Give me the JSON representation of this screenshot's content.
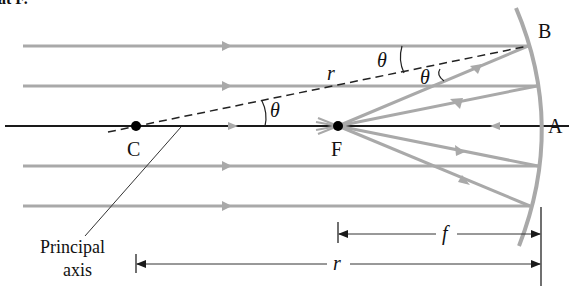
{
  "header": {
    "cutoff_text": "at F."
  },
  "diagram": {
    "colors": {
      "ray": "#a9a9a9",
      "axis": "#1a1a1a",
      "mirror": "#a9a9a9",
      "text": "#111111",
      "dashed": "#222222"
    },
    "labels": {
      "point_b": "B",
      "point_a": "A",
      "point_c": "C",
      "point_f": "F",
      "radius_r": "r",
      "theta_1": "θ",
      "theta_2": "θ",
      "theta_3": "θ",
      "dim_f": "f",
      "dim_r": "r",
      "principal_axis_line1": "Principal",
      "principal_axis_line2": "axis"
    },
    "incident_rays": [
      {
        "y": 46
      },
      {
        "y": 86
      },
      {
        "y": 126
      },
      {
        "y": 166
      },
      {
        "y": 206
      }
    ],
    "points": {
      "C": {
        "x": 136,
        "y": 126
      },
      "F": {
        "x": 338,
        "y": 126
      }
    }
  }
}
